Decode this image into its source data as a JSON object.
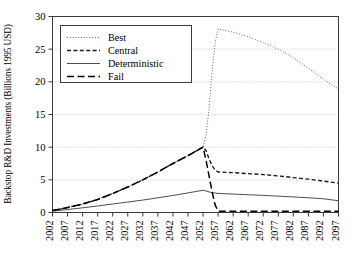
{
  "chart_data": {
    "type": "line",
    "title": "",
    "xlabel": "",
    "ylabel": "Backstop R&D Investments (Billions 1995 USD)",
    "xlim": [
      2002,
      2097
    ],
    "ylim": [
      0,
      30
    ],
    "xticks": [
      "2002",
      "2007",
      "2012",
      "2017",
      "2022",
      "2027",
      "2032",
      "2037",
      "2042",
      "2047",
      "2052",
      "2057",
      "2062",
      "2067",
      "2072",
      "2077",
      "2082",
      "2087",
      "2092",
      "2097"
    ],
    "yticks": [
      "0",
      "5",
      "10",
      "15",
      "20",
      "25",
      "30"
    ],
    "grid": true,
    "grid_axis": "y",
    "legend_position": "upper-left",
    "legend": [
      "Best",
      "Central",
      "Deterministic",
      "Fail"
    ],
    "x": [
      2002,
      2007,
      2012,
      2017,
      2022,
      2027,
      2032,
      2037,
      2042,
      2047,
      2052,
      2053,
      2054,
      2055,
      2056,
      2057,
      2062,
      2067,
      2072,
      2077,
      2082,
      2087,
      2092,
      2097
    ],
    "series": [
      {
        "name": "Best",
        "style": "dotted",
        "color": "#555555",
        "values": [
          0.3,
          0.75,
          1.3,
          2.0,
          2.9,
          3.9,
          5.0,
          6.2,
          7.5,
          8.7,
          10.0,
          11.8,
          16.0,
          21.5,
          26.0,
          28.1,
          27.6,
          26.9,
          26.0,
          25.0,
          23.7,
          22.1,
          20.4,
          18.9
        ]
      },
      {
        "name": "Central",
        "style": "dashed",
        "color": "#1a1a1a",
        "values": [
          0.3,
          0.75,
          1.3,
          2.0,
          2.9,
          3.9,
          5.0,
          6.2,
          7.5,
          8.7,
          10.0,
          9.5,
          8.2,
          7.2,
          6.5,
          6.2,
          6.1,
          5.95,
          5.8,
          5.6,
          5.35,
          5.1,
          4.8,
          4.5
        ]
      },
      {
        "name": "Deterministic",
        "style": "solid",
        "color": "#444444",
        "values": [
          0.2,
          0.45,
          0.72,
          1.0,
          1.3,
          1.6,
          1.9,
          2.25,
          2.6,
          3.0,
          3.4,
          3.3,
          3.15,
          3.05,
          2.98,
          2.92,
          2.82,
          2.72,
          2.62,
          2.5,
          2.38,
          2.25,
          2.1,
          1.8
        ]
      },
      {
        "name": "Fail",
        "style": "longdash",
        "color": "#000000",
        "values": [
          0.3,
          0.75,
          1.3,
          2.0,
          2.9,
          3.9,
          5.0,
          6.2,
          7.5,
          8.7,
          10.0,
          8.0,
          5.6,
          3.2,
          1.2,
          0.2,
          0.2,
          0.2,
          0.2,
          0.2,
          0.2,
          0.2,
          0.2,
          0.2
        ]
      }
    ]
  },
  "axes": {
    "frame_color": "#3b3b3b",
    "grid_color": "#b9b9b9"
  }
}
